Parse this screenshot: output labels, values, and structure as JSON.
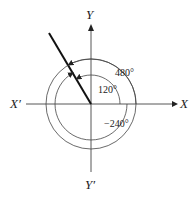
{
  "diagram": {
    "type": "angle-diagram",
    "axes": {
      "x_positive": "X",
      "x_negative": "X′",
      "y_positive": "Y",
      "y_negative": "Y′"
    },
    "terminal_ray_angle_deg": 120,
    "angles": [
      {
        "label": "120°",
        "value_deg": 120,
        "direction": "counterclockwise"
      },
      {
        "label": "480°",
        "value_deg": 480,
        "direction": "counterclockwise"
      },
      {
        "label": "−240°",
        "value_deg": -240,
        "direction": "clockwise"
      }
    ],
    "colors": {
      "line": "#222222",
      "background": "#ffffff"
    }
  }
}
